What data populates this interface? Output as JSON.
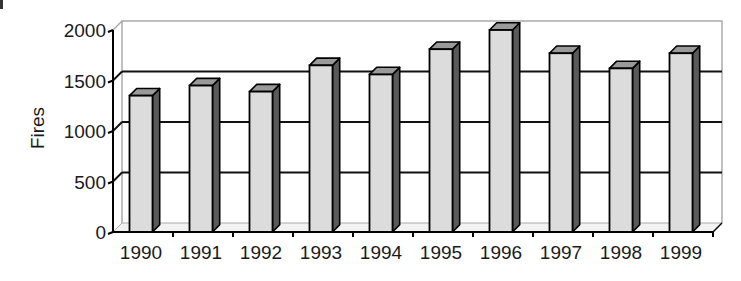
{
  "chart_data": {
    "type": "bar",
    "style": "3d-column",
    "title": "",
    "xlabel": "",
    "ylabel": "Fires",
    "categories": [
      "1990",
      "1991",
      "1992",
      "1993",
      "1994",
      "1995",
      "1996",
      "1997",
      "1998",
      "1999"
    ],
    "values": [
      1350,
      1450,
      1390,
      1650,
      1560,
      1810,
      2000,
      1770,
      1620,
      1770
    ],
    "ylim": [
      0,
      2000
    ],
    "yticks": [
      0,
      500,
      1000,
      1500,
      2000
    ],
    "ytick_labels": [
      "0",
      "500",
      "1000",
      "1500",
      "2000"
    ],
    "grid": true,
    "legend": null,
    "colors": {
      "bar_front": "#dcdcdc",
      "bar_top": "#9a9a9a",
      "bar_side": "#5a5a5a",
      "gridline": "#111111",
      "wall": "#aaaaaa"
    }
  }
}
